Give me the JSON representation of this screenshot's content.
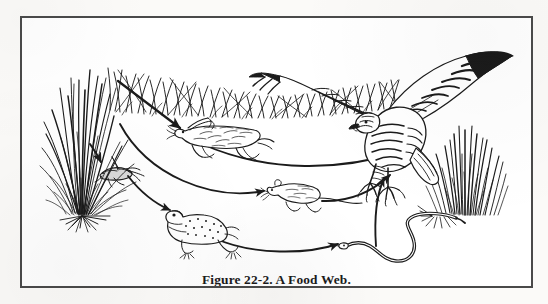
{
  "figure": {
    "caption": "Figure 22-2. A Food Web.",
    "border_color": "#4a4a4a",
    "ink_color": "#1b1b1b",
    "page_background": "#fbfaf8",
    "panel_background": "#ffffff"
  },
  "organisms": [
    {
      "id": "grass-left",
      "label": "grass",
      "role": "producer"
    },
    {
      "id": "grass-top",
      "label": "grass",
      "role": "producer"
    },
    {
      "id": "grass-right",
      "label": "grass",
      "role": "producer"
    },
    {
      "id": "grasshopper",
      "label": "grasshopper",
      "role": "primary consumer"
    },
    {
      "id": "rabbit",
      "label": "rabbit",
      "role": "primary consumer"
    },
    {
      "id": "frog",
      "label": "frog",
      "role": "secondary consumer"
    },
    {
      "id": "mouse",
      "label": "mouse",
      "role": "primary consumer"
    },
    {
      "id": "snake",
      "label": "snake",
      "role": "tertiary consumer"
    },
    {
      "id": "hawk",
      "label": "hawk",
      "role": "top predator"
    }
  ],
  "arrows": [
    {
      "id": "grass-to-rabbit",
      "from": "grass",
      "to": "rabbit",
      "style": "straight"
    },
    {
      "id": "grass-to-grasshopper",
      "from": "grass",
      "to": "grasshopper",
      "style": "short-curve"
    },
    {
      "id": "grass-to-mouse",
      "from": "grass",
      "to": "mouse",
      "style": "long-curve"
    },
    {
      "id": "grasshopper-to-frog",
      "from": "grasshopper",
      "to": "frog",
      "style": "curve"
    },
    {
      "id": "rabbit-to-hawk",
      "from": "rabbit",
      "to": "hawk",
      "style": "long-curve"
    },
    {
      "id": "mouse-to-hawk",
      "from": "mouse",
      "to": "hawk",
      "style": "curve"
    },
    {
      "id": "frog-to-snake",
      "from": "frog",
      "to": "snake",
      "style": "curve"
    },
    {
      "id": "snake-to-hawk",
      "from": "snake",
      "to": "hawk",
      "style": "steep-curve"
    }
  ]
}
